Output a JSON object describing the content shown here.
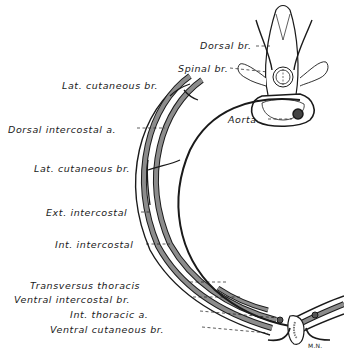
{
  "figure": {
    "type": "anatomical-cross-section",
    "colors": {
      "ink": "#1a1a1a",
      "muscle_fill": "#8c8c8c",
      "background": "#ffffff"
    },
    "labels": [
      {
        "id": "dorsal_br",
        "text": "Dorsal br."
      },
      {
        "id": "spinal_br",
        "text": "Spinal br."
      },
      {
        "id": "lat_cutaneous_br_upper",
        "text": "Lat. cutaneous br."
      },
      {
        "id": "dorsal_intercostal_a",
        "text": "Dorsal intercostal a."
      },
      {
        "id": "aorta",
        "text": "Aorta"
      },
      {
        "id": "lat_cutaneous_br_lower",
        "text": "Lat. cutaneous br."
      },
      {
        "id": "ext_intercostal",
        "text": "Ext. intercostal"
      },
      {
        "id": "int_intercostal",
        "text": "Int. intercostal"
      },
      {
        "id": "transversus_thoracis",
        "text": "Transversus thoracis"
      },
      {
        "id": "ventral_intercostal_br",
        "text": "Ventral intercostal br."
      },
      {
        "id": "int_thoracic_a",
        "text": "Int. thoracic a."
      },
      {
        "id": "ventral_cutaneous_br",
        "text": "Ventral cutaneous br."
      }
    ],
    "signature": "M.N."
  }
}
